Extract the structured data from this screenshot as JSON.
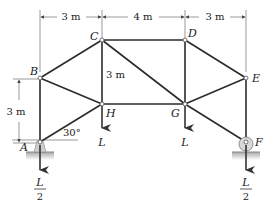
{
  "figure": {
    "type": "planar truss",
    "nodes": {
      "A": {
        "label": "A"
      },
      "B": {
        "label": "B"
      },
      "C": {
        "label": "C"
      },
      "D": {
        "label": "D"
      },
      "E": {
        "label": "E"
      },
      "F": {
        "label": "F"
      },
      "G": {
        "label": "G"
      },
      "H": {
        "label": "H"
      }
    },
    "members": [
      "AB",
      "BC",
      "CD",
      "DE",
      "EF",
      "AH",
      "BH",
      "CH",
      "CG",
      "DG",
      "HG",
      "GE",
      "GF"
    ],
    "dimensions": {
      "top_left": "3 m",
      "top_middle": "4 m",
      "top_right": "3 m",
      "vertical_CH": "3 m",
      "vertical_left": "3 m"
    },
    "angle": "30°",
    "loads": {
      "H": "L",
      "G": "L",
      "A_num": "L",
      "A_den": "2",
      "F_num": "L",
      "F_den": "2"
    },
    "supports": {
      "A": "pin",
      "F": "roller"
    },
    "colors": {
      "member": "#2b2b2b",
      "ground": "#b8b8b8",
      "support": "#c8c8c8"
    }
  }
}
